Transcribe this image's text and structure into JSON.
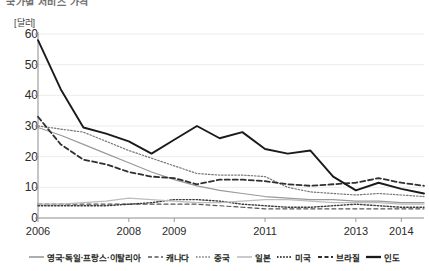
{
  "title_clipped": "국가별 서비스 가격",
  "axis": {
    "unit_label": "[달러]",
    "y_ticks": [
      0,
      10,
      20,
      30,
      40,
      50,
      60
    ],
    "x_ticks": [
      "2006",
      "2008",
      "2009",
      "2011",
      "2013",
      "2014"
    ]
  },
  "legend": [
    {
      "label": "영국·독일·프랑스·이탈리아",
      "style": "solid",
      "color": "#9a9a9a",
      "width": 1.2
    },
    {
      "label": "캐나다",
      "style": "dashed",
      "color": "#555555",
      "width": 1.2
    },
    {
      "label": "중국",
      "style": "dotted",
      "color": "#777777",
      "width": 1.2
    },
    {
      "label": "일본",
      "style": "solid",
      "color": "#bdbdbd",
      "width": 1.2
    },
    {
      "label": "미국",
      "style": "dotted",
      "color": "#3c3c3c",
      "width": 1.4
    },
    {
      "label": "브라질",
      "style": "dashed",
      "color": "#2f2f2f",
      "width": 1.8
    },
    {
      "label": "인도",
      "style": "solid",
      "color": "#1a1a1a",
      "width": 1.9
    }
  ],
  "chart_data": {
    "type": "line",
    "title": "국가별 서비스 가격",
    "xlabel": "",
    "ylabel": "[달러]",
    "ylim": [
      0,
      60
    ],
    "grid": true,
    "legend_position": "bottom",
    "x": [
      2006,
      2006.5,
      2007,
      2007.5,
      2008,
      2008.5,
      2009,
      2009.5,
      2010,
      2010.5,
      2011,
      2011.5,
      2012,
      2012.5,
      2013,
      2013.5,
      2014,
      2014.5
    ],
    "tick_x": [
      2006,
      2008,
      2009,
      2011,
      2013,
      2014
    ],
    "series": [
      {
        "name": "인도",
        "style": "solid",
        "color": "#1a1a1a",
        "width": 1.9,
        "values": [
          58.0,
          42.0,
          29.5,
          27.5,
          25.0,
          21.0,
          25.5,
          30.0,
          26.0,
          28.0,
          22.5,
          21.0,
          22.0,
          13.5,
          9.0,
          11.5,
          9.5,
          8.0
        ]
      },
      {
        "name": "브라질",
        "style": "dashed",
        "color": "#2f2f2f",
        "width": 1.8,
        "values": [
          33.0,
          24.0,
          19.0,
          17.5,
          15.0,
          13.5,
          13.0,
          11.0,
          12.5,
          12.5,
          12.0,
          11.0,
          10.5,
          11.0,
          11.5,
          13.0,
          11.5,
          10.5
        ]
      },
      {
        "name": "중국",
        "style": "dotted",
        "color": "#777777",
        "width": 1.2,
        "values": [
          30.0,
          29.0,
          28.0,
          25.0,
          22.0,
          19.5,
          17.0,
          14.5,
          14.0,
          14.0,
          13.5,
          10.0,
          8.5,
          8.0,
          7.5,
          8.0,
          7.5,
          7.0
        ]
      },
      {
        "name": "영국·독일·프랑스·이탈리아",
        "style": "solid",
        "color": "#9a9a9a",
        "width": 1.2,
        "values": [
          29.5,
          27.0,
          24.0,
          21.0,
          18.0,
          15.0,
          12.5,
          10.5,
          9.0,
          8.0,
          7.0,
          6.5,
          6.0,
          6.0,
          5.5,
          5.5,
          5.0,
          5.0
        ]
      },
      {
        "name": "일본",
        "style": "solid",
        "color": "#bdbdbd",
        "width": 1.2,
        "values": [
          4.5,
          4.5,
          5.0,
          5.5,
          6.5,
          6.0,
          5.5,
          5.0,
          5.0,
          5.5,
          6.0,
          6.0,
          5.5,
          5.0,
          5.0,
          5.0,
          4.5,
          4.5
        ]
      },
      {
        "name": "미국",
        "style": "dotted",
        "color": "#3c3c3c",
        "width": 1.4,
        "values": [
          4.0,
          4.0,
          4.0,
          4.0,
          4.5,
          5.0,
          6.0,
          6.0,
          5.5,
          4.5,
          4.0,
          3.5,
          3.5,
          4.0,
          4.5,
          4.0,
          3.5,
          3.5
        ]
      },
      {
        "name": "캐나다",
        "style": "dashed",
        "color": "#555555",
        "width": 1.2,
        "values": [
          4.5,
          4.5,
          4.5,
          4.5,
          4.5,
          4.5,
          4.5,
          4.5,
          4.0,
          3.5,
          3.0,
          3.0,
          3.0,
          3.0,
          3.0,
          3.0,
          3.0,
          3.0
        ]
      }
    ]
  }
}
